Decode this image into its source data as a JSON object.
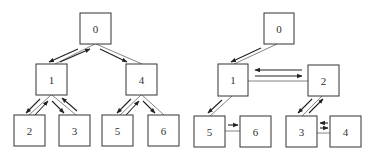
{
  "diagrams": [
    {
      "name": "tree",
      "nodes": [
        {
          "id": "0",
          "label": "0",
          "x": 80,
          "y": 13
        },
        {
          "id": "1",
          "label": "1",
          "x": 36,
          "y": 64
        },
        {
          "id": "4",
          "label": "4",
          "x": 126,
          "y": 64
        },
        {
          "id": "2",
          "label": "2",
          "x": 14,
          "y": 115
        },
        {
          "id": "3",
          "label": "3",
          "x": 59,
          "y": 115
        },
        {
          "id": "5",
          "label": "5",
          "x": 102,
          "y": 115
        },
        {
          "id": "6",
          "label": "6",
          "x": 148,
          "y": 115
        }
      ],
      "edges": [
        {
          "from": "0",
          "to": "1"
        },
        {
          "from": "0",
          "to": "4"
        },
        {
          "from": "1",
          "to": "2"
        },
        {
          "from": "1",
          "to": "3"
        },
        {
          "from": "4",
          "to": "5"
        },
        {
          "from": "4",
          "to": "6"
        }
      ],
      "traversal_arrows": [
        "0->1",
        "1->0",
        "0->4",
        "1->2",
        "2->1",
        "1->3",
        "3->1",
        "4->5",
        "5->4",
        "4->6"
      ]
    },
    {
      "name": "graph",
      "nodes": [
        {
          "id": "0",
          "label": "0",
          "x": 264,
          "y": 13
        },
        {
          "id": "1",
          "label": "1",
          "x": 218,
          "y": 64
        },
        {
          "id": "2",
          "label": "2",
          "x": 308,
          "y": 65
        },
        {
          "id": "5",
          "label": "5",
          "x": 194,
          "y": 116
        },
        {
          "id": "6",
          "label": "6",
          "x": 240,
          "y": 116
        },
        {
          "id": "3",
          "label": "3",
          "x": 286,
          "y": 116
        },
        {
          "id": "4",
          "label": "4",
          "x": 330,
          "y": 116
        }
      ],
      "edges": [
        {
          "from": "0",
          "to": "1"
        },
        {
          "from": "1",
          "to": "2"
        },
        {
          "from": "1",
          "to": "5"
        },
        {
          "from": "5",
          "to": "6"
        },
        {
          "from": "2",
          "to": "3"
        },
        {
          "from": "3",
          "to": "4"
        }
      ],
      "traversal_arrows": [
        "0->1",
        "1->2",
        "2->1",
        "1->5",
        "5->6",
        "2->3",
        "3->2",
        "3->4",
        "4->3"
      ]
    }
  ]
}
